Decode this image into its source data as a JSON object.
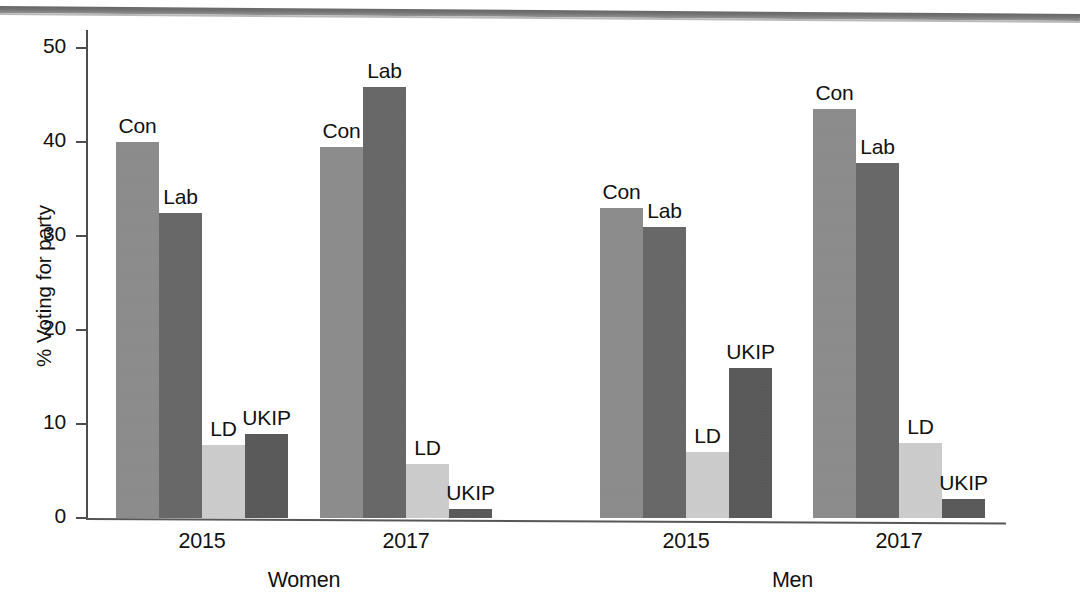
{
  "chart_data": {
    "type": "bar",
    "title": "",
    "subtitle": "",
    "xlabel": "",
    "ylabel": "% Voting for party",
    "ylim": [
      0,
      50
    ],
    "ytick_labels": [
      "50",
      "40",
      "30",
      "20",
      "10",
      "0"
    ],
    "ytick_values": [
      50,
      40,
      30,
      20,
      10,
      0
    ],
    "grid": false,
    "legend": "none",
    "annotations": "Each bar is directly labelled with its party name above the bar.",
    "categories": [
      "Women 2015",
      "Women 2017",
      "Men 2015",
      "Men 2017"
    ],
    "group_labels": [
      "Women",
      "Men"
    ],
    "year_labels": [
      "2015",
      "2017",
      "2015",
      "2017"
    ],
    "party_labels": [
      "Con",
      "Lab",
      "LD",
      "UKIP"
    ],
    "series": [
      {
        "name": "Con",
        "values": [
          40.0,
          39.5,
          33.0,
          43.5
        ]
      },
      {
        "name": "Lab",
        "values": [
          32.5,
          45.8,
          31.0,
          37.8
        ]
      },
      {
        "name": "LD",
        "values": [
          7.8,
          5.7,
          7.0,
          8.0
        ]
      },
      {
        "name": "UKIP",
        "values": [
          8.9,
          1.0,
          16.0,
          2.0
        ]
      }
    ],
    "groups": [
      {
        "sex": "Women",
        "year": "2015",
        "bars": [
          {
            "party": "Con",
            "value": 40.0,
            "color": "#8a8a8a"
          },
          {
            "party": "Lab",
            "value": 32.5,
            "color": "#636363"
          },
          {
            "party": "LD",
            "value": 7.8,
            "color": "#cfcfcf"
          },
          {
            "party": "UKIP",
            "value": 8.9,
            "color": "#545454"
          }
        ]
      },
      {
        "sex": "Women",
        "year": "2017",
        "bars": [
          {
            "party": "Con",
            "value": 39.5,
            "color": "#8a8a8a"
          },
          {
            "party": "Lab",
            "value": 45.8,
            "color": "#636363"
          },
          {
            "party": "LD",
            "value": 5.7,
            "color": "#cfcfcf"
          },
          {
            "party": "UKIP",
            "value": 1.0,
            "color": "#545454"
          }
        ]
      },
      {
        "sex": "Men",
        "year": "2015",
        "bars": [
          {
            "party": "Con",
            "value": 33.0,
            "color": "#8a8a8a"
          },
          {
            "party": "Lab",
            "value": 31.0,
            "color": "#636363"
          },
          {
            "party": "LD",
            "value": 7.0,
            "color": "#cfcfcf"
          },
          {
            "party": "UKIP",
            "value": 16.0,
            "color": "#545454"
          }
        ]
      },
      {
        "sex": "Men",
        "year": "2017",
        "bars": [
          {
            "party": "Con",
            "value": 43.5,
            "color": "#8a8a8a"
          },
          {
            "party": "Lab",
            "value": 37.8,
            "color": "#636363"
          },
          {
            "party": "LD",
            "value": 8.0,
            "color": "#cfcfcf"
          },
          {
            "party": "UKIP",
            "value": 2.0,
            "color": "#545454"
          }
        ]
      }
    ]
  },
  "layout": {
    "axis_color": "#4d4d4d",
    "text_color": "#111111",
    "background": "#ffffff",
    "group_left_px": [
      116,
      320,
      600,
      813
    ],
    "bar_width_px": 43,
    "baseline_y_px": 518,
    "top_value_y_px": 48
  }
}
